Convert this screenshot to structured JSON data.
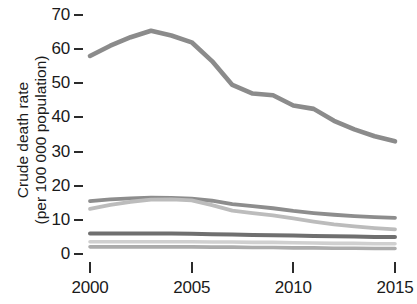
{
  "chart_data": {
    "type": "line",
    "title": "",
    "xlabel": "",
    "ylabel": "Crude death rate (per 100 000 population)",
    "ylabel_line1": "Crude death rate",
    "ylabel_line2": "(per 100 000 population)",
    "x": [
      2000,
      2001,
      2002,
      2003,
      2004,
      2005,
      2006,
      2007,
      2008,
      2009,
      2010,
      2011,
      2012,
      2013,
      2014,
      2015
    ],
    "xlim": [
      2000,
      2015
    ],
    "ylim": [
      0,
      70
    ],
    "xticks": [
      2000,
      2005,
      2010,
      2015
    ],
    "xtick_labels": [
      "2000",
      "2005",
      "2010",
      "2015"
    ],
    "yticks": [
      0,
      10,
      20,
      30,
      40,
      50,
      60,
      70
    ],
    "ytick_labels": [
      "0",
      "10",
      "20",
      "30",
      "40",
      "50",
      "60",
      "70"
    ],
    "grid": false,
    "legend": "none",
    "series": [
      {
        "name": "series-1",
        "color": "#8b8b8b",
        "width": 4.6,
        "values": [
          58.0,
          61.0,
          63.5,
          65.4,
          64.0,
          62.0,
          56.5,
          49.5,
          47.0,
          46.5,
          43.5,
          42.5,
          39.0,
          36.5,
          34.5,
          33.0
        ]
      },
      {
        "name": "series-2",
        "color": "#8d8d8d",
        "width": 3.8,
        "values": [
          15.5,
          16.0,
          16.3,
          16.5,
          16.4,
          16.2,
          15.6,
          14.6,
          14.0,
          13.4,
          12.6,
          12.0,
          11.5,
          11.1,
          10.8,
          10.6
        ]
      },
      {
        "name": "series-3",
        "color": "#bcbcbc",
        "width": 3.8,
        "values": [
          13.2,
          14.4,
          15.3,
          15.9,
          16.0,
          15.7,
          14.3,
          12.7,
          12.0,
          11.3,
          10.4,
          9.5,
          8.7,
          8.1,
          7.6,
          7.2
        ]
      },
      {
        "name": "series-4",
        "color": "#6f6f6f",
        "width": 4.0,
        "values": [
          6.0,
          6.0,
          6.0,
          6.0,
          6.0,
          5.9,
          5.8,
          5.7,
          5.6,
          5.5,
          5.4,
          5.3,
          5.2,
          5.1,
          5.0,
          5.0
        ]
      },
      {
        "name": "series-5",
        "color": "#d0d0d0",
        "width": 3.6,
        "values": [
          3.6,
          3.6,
          3.6,
          3.6,
          3.6,
          3.6,
          3.5,
          3.5,
          3.4,
          3.4,
          3.3,
          3.2,
          3.1,
          3.1,
          3.0,
          3.0
        ]
      },
      {
        "name": "series-6",
        "color": "#acacac",
        "width": 3.6,
        "values": [
          2.1,
          2.1,
          2.1,
          2.1,
          2.1,
          2.1,
          2.0,
          2.0,
          1.9,
          1.9,
          1.8,
          1.8,
          1.7,
          1.7,
          1.6,
          1.6
        ]
      }
    ]
  },
  "axis": {
    "tick_color": "#2b2b2b",
    "text_color": "#1a1a1a"
  }
}
